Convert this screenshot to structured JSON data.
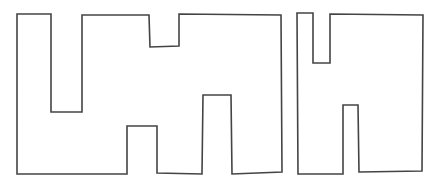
{
  "figure": {
    "stroke_color": "#444444",
    "background_color": "#ffffff",
    "shapes": [
      {
        "name": "left-shape",
        "label": "",
        "vertices": [
          [
            17,
            14
          ],
          [
            51,
            14
          ],
          [
            51,
            112
          ],
          [
            82,
            112
          ],
          [
            82,
            15
          ],
          [
            149,
            15
          ],
          [
            150,
            47
          ],
          [
            179,
            46
          ],
          [
            179,
            14
          ],
          [
            281,
            15
          ],
          [
            282,
            172
          ],
          [
            232,
            174
          ],
          [
            231,
            95
          ],
          [
            203,
            95
          ],
          [
            202,
            174
          ],
          [
            157,
            173
          ],
          [
            157,
            126
          ],
          [
            127,
            126
          ],
          [
            127,
            174
          ],
          [
            17,
            174
          ]
        ]
      },
      {
        "name": "right-shape",
        "label": "",
        "vertices": [
          [
            297,
            13
          ],
          [
            313,
            13
          ],
          [
            313,
            63
          ],
          [
            330,
            63
          ],
          [
            330,
            14
          ],
          [
            423,
            15
          ],
          [
            422,
            171
          ],
          [
            359,
            172
          ],
          [
            358,
            105
          ],
          [
            343,
            105
          ],
          [
            343,
            174
          ],
          [
            298,
            174
          ]
        ]
      }
    ]
  }
}
